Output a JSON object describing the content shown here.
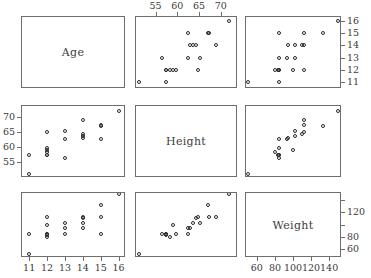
{
  "figure": {
    "type": "scatterplot-matrix",
    "variables": [
      "Age",
      "Height",
      "Weight"
    ],
    "n_points": 19,
    "background": "#ffffff",
    "point_color": "#2b2b2b",
    "axis_color": "#6e6e6e",
    "label_color": "#3d3d3d"
  },
  "diagonal": {
    "age_label": "Age",
    "height_label": "Height",
    "weight_label": "Weight"
  },
  "axes": {
    "age": {
      "label": "Age",
      "min": 10.6,
      "max": 16.3,
      "ticks": [
        11,
        12,
        13,
        14,
        15,
        16
      ],
      "ticklabels": [
        "11",
        "12",
        "13",
        "14",
        "15",
        "16"
      ]
    },
    "height": {
      "label": "Height",
      "min": 50.5,
      "max": 73.5,
      "ticks": [
        55,
        60,
        65,
        70
      ],
      "ticklabels": [
        "55",
        "60",
        "65",
        "70"
      ]
    },
    "weight": {
      "label": "Weight",
      "min": 48,
      "max": 152,
      "ticks": [
        60,
        80,
        100,
        120,
        140
      ],
      "ticklabels": [
        "60",
        "80",
        "100",
        "120",
        "140"
      ]
    }
  },
  "chart_data": {
    "type": "scatter",
    "title": "",
    "xlabel": "",
    "ylabel": "",
    "variables": [
      "Age",
      "Height",
      "Weight"
    ],
    "axis_ranges": {
      "Age": [
        10.6,
        16.3
      ],
      "Height": [
        50.5,
        73.5
      ],
      "Weight": [
        48,
        152
      ]
    },
    "axis_ticks": {
      "Age": [
        11,
        12,
        13,
        14,
        15,
        16
      ],
      "Height": [
        55,
        60,
        65,
        70
      ],
      "Weight": [
        60,
        80,
        100,
        120,
        140
      ]
    },
    "grid": false,
    "legend": "none",
    "points": [
      {
        "Age": 11.0,
        "Height": 51.3,
        "Weight": 50.5
      },
      {
        "Age": 11.0,
        "Height": 57.5,
        "Weight": 85.0
      },
      {
        "Age": 12.0,
        "Height": 57.3,
        "Weight": 83.0
      },
      {
        "Age": 12.0,
        "Height": 57.5,
        "Weight": 84.0
      },
      {
        "Age": 12.0,
        "Height": 59.0,
        "Weight": 99.5
      },
      {
        "Age": 12.0,
        "Height": 59.8,
        "Weight": 84.5
      },
      {
        "Age": 12.0,
        "Height": 64.8,
        "Weight": 112.5
      },
      {
        "Age": 12.0,
        "Height": 58.3,
        "Weight": 80.0
      },
      {
        "Age": 13.0,
        "Height": 56.5,
        "Weight": 84.0
      },
      {
        "Age": 13.0,
        "Height": 62.5,
        "Weight": 93.5
      },
      {
        "Age": 13.0,
        "Height": 65.3,
        "Weight": 102.5
      },
      {
        "Age": 14.0,
        "Height": 63.5,
        "Weight": 102.5
      },
      {
        "Age": 14.0,
        "Height": 64.3,
        "Weight": 110.0
      },
      {
        "Age": 14.0,
        "Height": 63.0,
        "Weight": 94.5
      },
      {
        "Age": 14.0,
        "Height": 69.0,
        "Weight": 112.5
      },
      {
        "Age": 15.0,
        "Height": 67.0,
        "Weight": 133.0
      },
      {
        "Age": 15.0,
        "Height": 67.3,
        "Weight": 112.0
      },
      {
        "Age": 15.0,
        "Height": 62.5,
        "Weight": 84.0
      },
      {
        "Age": 16.0,
        "Height": 72.0,
        "Weight": 150.0
      }
    ],
    "panels": [
      {
        "row": 0,
        "col": 0,
        "kind": "diagonal",
        "variable": "Age"
      },
      {
        "row": 0,
        "col": 1,
        "kind": "scatter",
        "x": "Height",
        "y": "Age"
      },
      {
        "row": 0,
        "col": 2,
        "kind": "scatter",
        "x": "Weight",
        "y": "Age"
      },
      {
        "row": 1,
        "col": 0,
        "kind": "scatter",
        "x": "Age",
        "y": "Height"
      },
      {
        "row": 1,
        "col": 1,
        "kind": "diagonal",
        "variable": "Height"
      },
      {
        "row": 1,
        "col": 2,
        "kind": "scatter",
        "x": "Weight",
        "y": "Height"
      },
      {
        "row": 2,
        "col": 0,
        "kind": "scatter",
        "x": "Age",
        "y": "Weight"
      },
      {
        "row": 2,
        "col": 1,
        "kind": "scatter",
        "x": "Height",
        "y": "Weight"
      },
      {
        "row": 2,
        "col": 2,
        "kind": "diagonal",
        "variable": "Weight"
      }
    ],
    "axis_placement": {
      "Height_top": "column 1 top",
      "Age_right": "column 2 right",
      "Height_left": "row 1 left",
      "Weight_right": "row 2 right",
      "Age_bottom": "column 0 bottom",
      "Weight_bottom": "column 2 bottom"
    }
  }
}
